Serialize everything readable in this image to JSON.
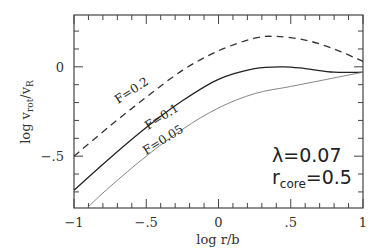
{
  "chart_data": {
    "type": "line",
    "title": "",
    "xlabel": "log r/b",
    "ylabel": "log v_rot/v_R",
    "ylabel_parts": {
      "main": "log v",
      "sub1": "rot",
      "mid": "/v",
      "sub2": "R"
    },
    "xlim": [
      -1,
      1
    ],
    "ylim": [
      -0.79,
      0.29
    ],
    "x_ticks": [
      -1,
      -0.5,
      0,
      0.5,
      1
    ],
    "x_tick_labels": [
      "−1",
      "−.5",
      "0",
      ".5",
      "1"
    ],
    "y_ticks": [
      0,
      -0.5
    ],
    "y_tick_labels": [
      "0",
      "−.5"
    ],
    "grid": false,
    "legend": "inline labels on curves",
    "series": [
      {
        "name": "F=0.2",
        "style": "dashed",
        "x": [
          -1,
          -0.75,
          -0.5,
          -0.25,
          0,
          0.25,
          0.4,
          0.6,
          0.8,
          1
        ],
        "y": [
          -0.5,
          -0.33,
          -0.17,
          -0.02,
          0.09,
          0.16,
          0.17,
          0.15,
          0.1,
          0.03
        ]
      },
      {
        "name": "F=0.1",
        "style": "solid",
        "x": [
          -1,
          -0.75,
          -0.5,
          -0.25,
          0,
          0.25,
          0.45,
          0.6,
          0.8,
          1
        ],
        "y": [
          -0.69,
          -0.51,
          -0.34,
          -0.19,
          -0.07,
          -0.01,
          0.0,
          -0.01,
          -0.03,
          -0.03
        ]
      },
      {
        "name": "F=0.05",
        "style": "dotted",
        "x": [
          -0.91,
          -0.75,
          -0.5,
          -0.25,
          0,
          0.25,
          0.5,
          0.75,
          1
        ],
        "y": [
          -0.79,
          -0.67,
          -0.5,
          -0.35,
          -0.23,
          -0.15,
          -0.11,
          -0.07,
          -0.03
        ]
      }
    ],
    "annotations": [
      {
        "text": "λ=0.07",
        "main": "λ=0.07"
      },
      {
        "text": "r_core=0.5",
        "main": "r",
        "sub": "core",
        "tail": "=0.5"
      }
    ]
  }
}
